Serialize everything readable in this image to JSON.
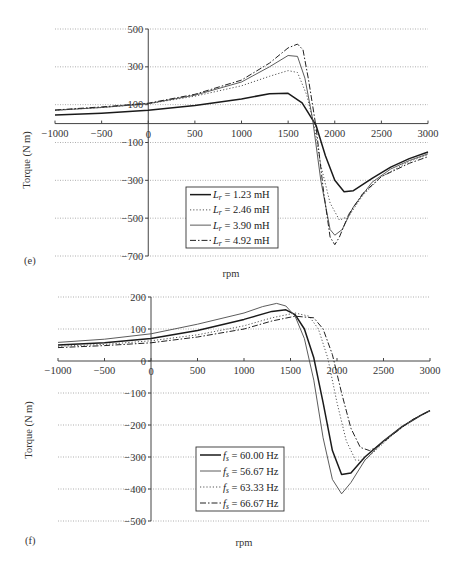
{
  "chart_data": [
    {
      "panel": "(e)",
      "type": "line",
      "title": "",
      "xlabel": "rpm",
      "ylabel": "Torque (N m)",
      "xlim": [
        -1000,
        3000
      ],
      "ylim": [
        -700,
        500
      ],
      "xticks": [
        -1000,
        -500,
        0,
        500,
        1000,
        1500,
        2000,
        2500,
        3000
      ],
      "yticks": [
        500,
        300,
        100,
        -100,
        -300,
        -500,
        -700
      ],
      "grid": true,
      "legend_position": "lower-center inside",
      "series": [
        {
          "name": "L_r = 1.23 mH",
          "style": "solid-thick",
          "x": [
            -1000,
            -500,
            0,
            500,
            1000,
            1300,
            1500,
            1650,
            1750,
            1800,
            1900,
            2000,
            2100,
            2200,
            2400,
            2600,
            2800,
            3000
          ],
          "y": [
            45,
            55,
            70,
            95,
            130,
            158,
            160,
            110,
            30,
            -10,
            -170,
            -300,
            -360,
            -355,
            -290,
            -230,
            -185,
            -150
          ]
        },
        {
          "name": "L_r = 2.46 mH",
          "style": "dotted",
          "x": [
            -1000,
            -500,
            0,
            500,
            1000,
            1300,
            1500,
            1600,
            1700,
            1780,
            1850,
            1950,
            2050,
            2150,
            2300,
            2500,
            2800,
            3000
          ],
          "y": [
            70,
            85,
            105,
            145,
            200,
            250,
            280,
            270,
            150,
            -10,
            -220,
            -420,
            -510,
            -490,
            -380,
            -280,
            -200,
            -165
          ]
        },
        {
          "name": "L_r = 3.90 mH",
          "style": "solid-thin",
          "x": [
            -1000,
            -500,
            0,
            500,
            1000,
            1300,
            1500,
            1600,
            1680,
            1760,
            1850,
            1950,
            2000,
            2080,
            2200,
            2400,
            2600,
            2800,
            3000
          ],
          "y": [
            70,
            85,
            105,
            150,
            220,
            300,
            360,
            355,
            240,
            30,
            -300,
            -560,
            -590,
            -560,
            -440,
            -310,
            -240,
            -195,
            -160
          ]
        },
        {
          "name": "L_r = 4.92 mH",
          "style": "dash-dot",
          "x": [
            -1000,
            -500,
            0,
            500,
            1000,
            1300,
            1500,
            1600,
            1660,
            1720,
            1800,
            1880,
            1950,
            2000,
            2050,
            2150,
            2300,
            2500,
            2800,
            3000
          ],
          "y": [
            72,
            88,
            108,
            155,
            230,
            320,
            400,
            420,
            390,
            230,
            -20,
            -360,
            -600,
            -640,
            -600,
            -480,
            -370,
            -280,
            -210,
            -175
          ]
        }
      ]
    },
    {
      "panel": "(f)",
      "type": "line",
      "title": "",
      "xlabel": "rpm",
      "ylabel": "Torque (N m)",
      "xlim": [
        -1000,
        3000
      ],
      "ylim": [
        -500,
        200
      ],
      "xticks": [
        -1000,
        -500,
        0,
        500,
        1000,
        1500,
        2000,
        2500,
        3000
      ],
      "yticks": [
        200,
        100,
        0,
        -100,
        -200,
        -300,
        -400,
        -500
      ],
      "grid": true,
      "legend_position": "lower-center inside",
      "series": [
        {
          "name": "f_s = 60.00 Hz",
          "style": "solid-thick",
          "x": [
            -1000,
            -500,
            0,
            500,
            1000,
            1300,
            1450,
            1550,
            1650,
            1750,
            1850,
            1950,
            2050,
            2150,
            2300,
            2500,
            2700,
            2900,
            3000
          ],
          "y": [
            50,
            57,
            70,
            95,
            130,
            155,
            160,
            145,
            100,
            10,
            -130,
            -280,
            -355,
            -350,
            -300,
            -250,
            -205,
            -170,
            -155
          ]
        },
        {
          "name": "f_s = 56.67 Hz",
          "style": "solid-thin",
          "x": [
            -1000,
            -500,
            0,
            500,
            1000,
            1200,
            1350,
            1450,
            1550,
            1650,
            1750,
            1850,
            1950,
            2050,
            2150,
            2300,
            2500,
            2700,
            2900,
            3000
          ],
          "y": [
            58,
            68,
            85,
            115,
            150,
            170,
            180,
            172,
            140,
            70,
            -60,
            -240,
            -370,
            -415,
            -380,
            -310,
            -250,
            -205,
            -170,
            -155
          ]
        },
        {
          "name": "f_s = 63.33 Hz",
          "style": "dotted",
          "x": [
            -1000,
            -500,
            0,
            500,
            1000,
            1300,
            1550,
            1700,
            1800,
            1900,
            2000,
            2100,
            2200,
            2300,
            2450,
            2600,
            2800,
            3000
          ],
          "y": [
            46,
            52,
            63,
            82,
            110,
            135,
            150,
            140,
            100,
            10,
            -130,
            -250,
            -310,
            -310,
            -270,
            -230,
            -185,
            -155
          ]
        },
        {
          "name": "f_s = 66.67 Hz",
          "style": "dash-dot",
          "x": [
            -1000,
            -500,
            0,
            500,
            1000,
            1300,
            1550,
            1750,
            1850,
            1950,
            2050,
            2150,
            2250,
            2350,
            2450,
            2600,
            2800,
            3000
          ],
          "y": [
            42,
            48,
            57,
            75,
            100,
            125,
            140,
            135,
            100,
            20,
            -100,
            -210,
            -270,
            -280,
            -265,
            -230,
            -185,
            -155
          ]
        }
      ]
    }
  ],
  "panels": {
    "e": {
      "label": "(e)",
      "ylabel": "Torque (N m)",
      "xlabel": "rpm",
      "legend": [
        "L_r = 1.23 mH",
        "L_r = 2.46 mH",
        "L_r = 3.90 mH",
        "L_r = 4.92 mH"
      ]
    },
    "f": {
      "label": "(f)",
      "ylabel": "Torque (N m)",
      "xlabel": "rpm",
      "legend": [
        "f_s = 60.00 Hz",
        "f_s = 56.67 Hz",
        "f_s = 63.33 Hz",
        "f_s = 66.67 Hz"
      ]
    }
  }
}
